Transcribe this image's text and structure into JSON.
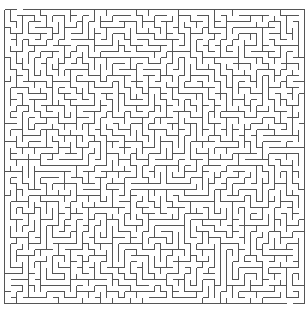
{
  "maze": {
    "cols": 50,
    "rows": 49,
    "cell_size": 6,
    "origin_x": 4,
    "origin_y": 9,
    "wall_color": "#555555",
    "background": "#ffffff",
    "wall_width": 1,
    "entrance": {
      "col": 2,
      "side": "top"
    },
    "exit": {
      "col": 47,
      "side": "bottom"
    },
    "seed": 12345
  }
}
